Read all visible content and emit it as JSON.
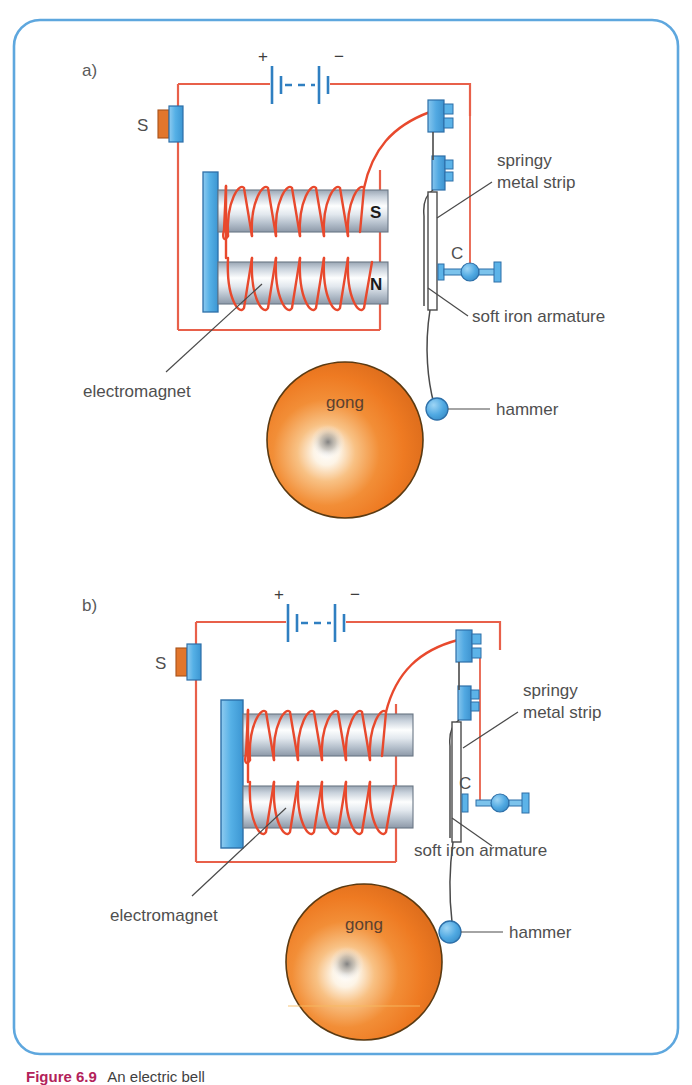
{
  "figure": {
    "border_color": "#5ea7de",
    "background": "#ffffff",
    "width": 692,
    "height": 1085
  },
  "palette": {
    "wire_red": "#e8604a",
    "coil_red": "#e8492d",
    "battery_blue": "#2f7fc1",
    "part_blue": "#5cb3e8",
    "part_blue_dark": "#2d6fa8",
    "switch_orange": "#e2762c",
    "gong_orange": "#ef7e26",
    "gong_edge": "#5a3a12",
    "core_light": "#fbfcfd",
    "core_mid": "#c2cbd6",
    "core_dark": "#8d99a8",
    "leader_gray": "#4a4a4a",
    "text_gray": "#4f4f4f"
  },
  "panels": [
    {
      "id": "a",
      "panel_label": "a)",
      "switch_label": "S",
      "battery": {
        "plus": "+",
        "minus": "−"
      },
      "cores": [
        {
          "pole": "S"
        },
        {
          "pole": "N"
        }
      ],
      "contact_label": "C",
      "contact_state": "closed",
      "hammer_state": "away-from-gong",
      "labels": {
        "springy_line1": "springy",
        "springy_line2": "metal strip",
        "armature": "soft iron armature",
        "electromagnet": "electromagnet",
        "gong": "gong",
        "hammer": "hammer"
      }
    },
    {
      "id": "b",
      "panel_label": "b)",
      "switch_label": "S",
      "battery": {
        "plus": "+",
        "minus": "−"
      },
      "cores": [
        {
          "pole": ""
        },
        {
          "pole": ""
        }
      ],
      "contact_label": "C",
      "contact_state": "open",
      "hammer_state": "striking-gong",
      "labels": {
        "springy_line1": "springy",
        "springy_line2": "metal strip",
        "armature": "soft iron armature",
        "electromagnet": "electromagnet",
        "gong": "gong",
        "hammer": "hammer"
      }
    }
  ],
  "caption": {
    "lead": "Figure 6.9",
    "text": "An electric bell"
  }
}
